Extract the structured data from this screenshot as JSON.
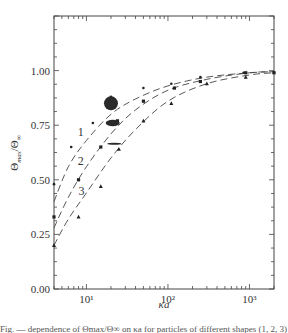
{
  "chart_data": {
    "type": "line",
    "title": "",
    "xlabel": "κa",
    "ylabel": "Θ_max / Θ_∞",
    "xscale": "log",
    "xlim": [
      4,
      2000
    ],
    "ylim": [
      0.0,
      1.25
    ],
    "grid": false,
    "legend": "inline curve labels 1, 2, 3",
    "x_ticks": [
      {
        "value": 10,
        "label": "10¹"
      },
      {
        "value": 100,
        "label": "10²"
      },
      {
        "value": 1000,
        "label": "10³"
      }
    ],
    "y_ticks": [
      {
        "value": 0.0,
        "label": "0.00"
      },
      {
        "value": 0.25,
        "label": "0.25"
      },
      {
        "value": 0.5,
        "label": "0.50"
      },
      {
        "value": 0.75,
        "label": "0.75"
      },
      {
        "value": 1.0,
        "label": "1.00"
      }
    ],
    "series": [
      {
        "name": "1",
        "marker": "dot",
        "curve": [
          [
            4,
            0.4
          ],
          [
            6,
            0.56
          ],
          [
            10,
            0.68
          ],
          [
            20,
            0.8
          ],
          [
            40,
            0.87
          ],
          [
            100,
            0.93
          ],
          [
            300,
            0.97
          ],
          [
            1000,
            0.99
          ],
          [
            2000,
            0.995
          ]
        ],
        "points": [
          [
            4,
            0.48
          ],
          [
            6.5,
            0.65
          ],
          [
            12,
            0.76
          ],
          [
            20,
            0.88
          ],
          [
            50,
            0.92
          ],
          [
            110,
            0.94
          ],
          [
            250,
            0.97
          ],
          [
            850,
            0.99
          ],
          [
            2000,
            0.99
          ]
        ]
      },
      {
        "name": "2",
        "marker": "square",
        "curve": [
          [
            4,
            0.28
          ],
          [
            6,
            0.42
          ],
          [
            10,
            0.56
          ],
          [
            20,
            0.71
          ],
          [
            40,
            0.82
          ],
          [
            100,
            0.91
          ],
          [
            300,
            0.96
          ],
          [
            1000,
            0.99
          ],
          [
            2000,
            0.995
          ]
        ],
        "points": [
          [
            4,
            0.33
          ],
          [
            8,
            0.5
          ],
          [
            15,
            0.65
          ],
          [
            24,
            0.77
          ],
          [
            50,
            0.86
          ],
          [
            120,
            0.92
          ],
          [
            250,
            0.95
          ],
          [
            900,
            0.99
          ],
          [
            2000,
            0.99
          ]
        ]
      },
      {
        "name": "3",
        "marker": "triangle",
        "curve": [
          [
            4,
            0.2
          ],
          [
            6,
            0.32
          ],
          [
            10,
            0.44
          ],
          [
            20,
            0.6
          ],
          [
            40,
            0.73
          ],
          [
            100,
            0.86
          ],
          [
            300,
            0.94
          ],
          [
            1000,
            0.98
          ],
          [
            2000,
            0.99
          ]
        ],
        "points": [
          [
            4,
            0.2
          ],
          [
            8,
            0.33
          ],
          [
            15,
            0.47
          ],
          [
            25,
            0.64
          ],
          [
            50,
            0.77
          ],
          [
            110,
            0.85
          ],
          [
            300,
            0.94
          ],
          [
            900,
            0.97
          ]
        ]
      }
    ],
    "annotations": [
      {
        "type": "particle-shape",
        "shape": "sphere",
        "x": 20,
        "y": 0.85
      },
      {
        "type": "particle-shape",
        "shape": "oblate-ellipsoid",
        "x": 21,
        "y": 0.76
      },
      {
        "type": "particle-shape",
        "shape": "disk",
        "x": 22,
        "y": 0.665
      }
    ],
    "curve_labels": [
      {
        "text": "1",
        "x": 8.5,
        "y": 0.7
      },
      {
        "text": "2",
        "x": 8.5,
        "y": 0.57
      },
      {
        "text": "3",
        "x": 8.7,
        "y": 0.43
      }
    ]
  },
  "axes": {
    "xlabel": "κa",
    "ylabel_main": "Θ",
    "ylabel_sub": "max",
    "ylabel_den": "/Θ",
    "ylabel_den_sub": "∞"
  },
  "caption": "Fig. — dependence of Θmax/Θ∞ on κa for particles of different shapes (1, 2, 3)"
}
